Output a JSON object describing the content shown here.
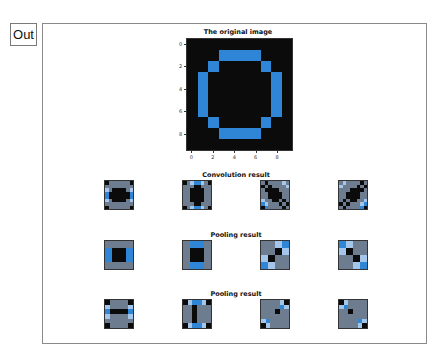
{
  "out_label": "Out",
  "palette": {
    "0": "#0b0b0b",
    "1": "#2f86d6",
    "2": "#a3c6ea",
    "3": "#6d7d8f"
  },
  "chart_data": [
    {
      "type": "heatmap",
      "title": "The original image",
      "xticks": [
        "0",
        "2",
        "4",
        "6",
        "8"
      ],
      "yticks": [
        "0",
        "2",
        "4",
        "6",
        "8"
      ],
      "grid": [
        [
          0,
          0,
          0,
          0,
          0,
          0,
          0,
          0,
          0,
          0
        ],
        [
          0,
          0,
          0,
          1,
          1,
          1,
          1,
          0,
          0,
          0
        ],
        [
          0,
          0,
          1,
          0,
          0,
          0,
          0,
          1,
          0,
          0
        ],
        [
          0,
          1,
          0,
          0,
          0,
          0,
          0,
          0,
          1,
          0
        ],
        [
          0,
          1,
          0,
          0,
          0,
          0,
          0,
          0,
          1,
          0
        ],
        [
          0,
          1,
          0,
          0,
          0,
          0,
          0,
          0,
          1,
          0
        ],
        [
          0,
          1,
          0,
          0,
          0,
          0,
          0,
          0,
          1,
          0
        ],
        [
          0,
          0,
          1,
          0,
          0,
          0,
          0,
          1,
          0,
          0
        ],
        [
          0,
          0,
          0,
          1,
          1,
          1,
          1,
          0,
          0,
          0
        ],
        [
          0,
          0,
          0,
          0,
          0,
          0,
          0,
          0,
          0,
          0
        ]
      ]
    },
    {
      "type": "heatmap",
      "title": "Convolution result",
      "panels": [
        [
          [
            0,
            3,
            3,
            3,
            3,
            3,
            3,
            0
          ],
          [
            3,
            3,
            3,
            3,
            3,
            3,
            3,
            3
          ],
          [
            2,
            3,
            0,
            0,
            0,
            0,
            3,
            2
          ],
          [
            1,
            0,
            0,
            0,
            0,
            0,
            0,
            1
          ],
          [
            1,
            0,
            0,
            0,
            0,
            0,
            0,
            1
          ],
          [
            2,
            3,
            0,
            0,
            0,
            0,
            3,
            2
          ],
          [
            3,
            3,
            3,
            3,
            3,
            3,
            3,
            3
          ],
          [
            0,
            3,
            3,
            3,
            3,
            3,
            3,
            0
          ]
        ],
        [
          [
            0,
            3,
            2,
            1,
            1,
            2,
            3,
            0
          ],
          [
            3,
            3,
            3,
            0,
            0,
            3,
            3,
            3
          ],
          [
            3,
            3,
            0,
            0,
            0,
            0,
            3,
            3
          ],
          [
            3,
            3,
            0,
            0,
            0,
            0,
            3,
            3
          ],
          [
            3,
            3,
            0,
            0,
            0,
            0,
            3,
            3
          ],
          [
            3,
            3,
            0,
            0,
            0,
            0,
            3,
            3
          ],
          [
            3,
            3,
            3,
            0,
            0,
            3,
            3,
            3
          ],
          [
            0,
            3,
            2,
            1,
            1,
            2,
            3,
            0
          ]
        ],
        [
          [
            3,
            0,
            3,
            3,
            3,
            3,
            2,
            3
          ],
          [
            0,
            3,
            0,
            3,
            3,
            3,
            3,
            2
          ],
          [
            3,
            0,
            0,
            0,
            0,
            3,
            3,
            3
          ],
          [
            3,
            3,
            0,
            0,
            0,
            0,
            3,
            3
          ],
          [
            3,
            3,
            0,
            0,
            0,
            0,
            3,
            3
          ],
          [
            2,
            3,
            3,
            0,
            0,
            3,
            0,
            3
          ],
          [
            1,
            2,
            3,
            3,
            3,
            0,
            3,
            0
          ],
          [
            0,
            1,
            3,
            3,
            3,
            3,
            0,
            3
          ]
        ],
        [
          [
            3,
            2,
            3,
            3,
            3,
            3,
            0,
            3
          ],
          [
            2,
            3,
            3,
            3,
            3,
            0,
            3,
            0
          ],
          [
            3,
            3,
            3,
            0,
            0,
            0,
            0,
            3
          ],
          [
            3,
            3,
            0,
            0,
            0,
            0,
            3,
            3
          ],
          [
            3,
            3,
            0,
            0,
            0,
            0,
            3,
            3
          ],
          [
            3,
            0,
            3,
            0,
            0,
            3,
            3,
            2
          ],
          [
            0,
            3,
            0,
            3,
            3,
            3,
            2,
            1
          ],
          [
            3,
            0,
            3,
            3,
            3,
            3,
            1,
            0
          ]
        ]
      ]
    },
    {
      "type": "heatmap",
      "title": "Pooling result",
      "panels": [
        [
          [
            3,
            3,
            3,
            3
          ],
          [
            1,
            0,
            0,
            1
          ],
          [
            1,
            0,
            0,
            1
          ],
          [
            3,
            3,
            3,
            3
          ]
        ],
        [
          [
            3,
            1,
            1,
            3
          ],
          [
            3,
            0,
            0,
            3
          ],
          [
            3,
            0,
            0,
            3
          ],
          [
            3,
            1,
            1,
            3
          ]
        ],
        [
          [
            3,
            3,
            2,
            1
          ],
          [
            3,
            3,
            0,
            2
          ],
          [
            2,
            0,
            3,
            3
          ],
          [
            1,
            2,
            3,
            3
          ]
        ],
        [
          [
            1,
            2,
            3,
            3
          ],
          [
            2,
            0,
            3,
            3
          ],
          [
            3,
            3,
            0,
            2
          ],
          [
            3,
            3,
            2,
            1
          ]
        ]
      ]
    },
    {
      "type": "heatmap",
      "title": "Pooling result",
      "panels": [
        [
          [
            0,
            3,
            3,
            3,
            3,
            0
          ],
          [
            2,
            3,
            3,
            3,
            3,
            2
          ],
          [
            1,
            0,
            0,
            0,
            0,
            1
          ],
          [
            2,
            3,
            3,
            3,
            3,
            2
          ],
          [
            3,
            3,
            3,
            3,
            3,
            3
          ],
          [
            0,
            3,
            3,
            3,
            3,
            0
          ]
        ],
        [
          [
            0,
            2,
            1,
            1,
            2,
            0
          ],
          [
            3,
            3,
            0,
            3,
            3,
            3
          ],
          [
            3,
            3,
            0,
            3,
            3,
            3
          ],
          [
            3,
            3,
            0,
            3,
            3,
            3
          ],
          [
            3,
            3,
            0,
            3,
            3,
            3
          ],
          [
            0,
            2,
            1,
            1,
            2,
            0
          ]
        ],
        [
          [
            3,
            3,
            3,
            3,
            2,
            0
          ],
          [
            3,
            3,
            3,
            3,
            1,
            2
          ],
          [
            3,
            3,
            3,
            0,
            3,
            3
          ],
          [
            3,
            3,
            3,
            3,
            3,
            3
          ],
          [
            2,
            1,
            3,
            3,
            3,
            3
          ],
          [
            0,
            2,
            3,
            3,
            3,
            3
          ]
        ],
        [
          [
            0,
            2,
            3,
            3,
            3,
            3
          ],
          [
            2,
            1,
            3,
            3,
            3,
            3
          ],
          [
            3,
            3,
            0,
            3,
            3,
            3
          ],
          [
            3,
            3,
            3,
            3,
            3,
            3
          ],
          [
            3,
            3,
            3,
            3,
            1,
            2
          ],
          [
            3,
            3,
            3,
            3,
            2,
            0
          ]
        ]
      ]
    }
  ]
}
